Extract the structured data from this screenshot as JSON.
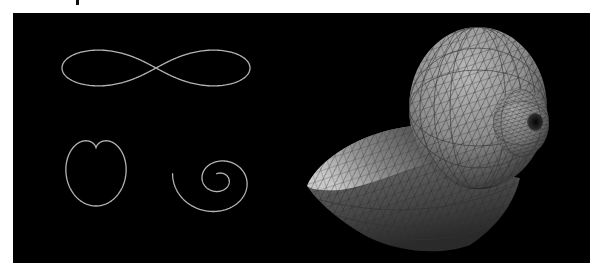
{
  "figure": {
    "background_color": "#000000",
    "page_color": "#ffffff",
    "curve_color": "#b4b4b4",
    "shell_base_color": "#8c8c8c",
    "curves": [
      {
        "name": "lemniscate",
        "description": "figure-eight curve"
      },
      {
        "name": "cardioid",
        "description": "heart-shaped curve"
      },
      {
        "name": "spiral",
        "description": "logarithmic spiral"
      }
    ],
    "surface": {
      "name": "seashell",
      "description": "triangulated mesh of a spiral seashell surface"
    }
  }
}
